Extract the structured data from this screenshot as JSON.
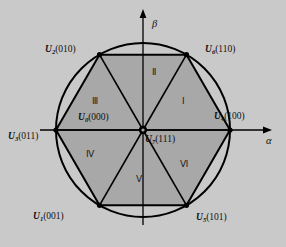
{
  "figure": {
    "kind": "space-vector-hexagon",
    "background_color": "#c9c9c9",
    "hexagon_fill": "#a8a8a8",
    "line_color": "#000000",
    "center": {
      "x": 143,
      "y": 130
    },
    "circle_radius": 87,
    "hexagon_radius": 87
  },
  "axes": {
    "alpha": {
      "label": "α",
      "direction": "right"
    },
    "beta": {
      "label": "β",
      "direction": "up"
    }
  },
  "vectors": [
    {
      "id": "U4",
      "name": "U",
      "index": "4",
      "bits": "(100)",
      "angle_deg": 0,
      "label": "U4(100)"
    },
    {
      "id": "U6",
      "name": "U",
      "index": "6",
      "bits": "(110)",
      "angle_deg": 60,
      "label": "U6(110)"
    },
    {
      "id": "U2",
      "name": "U",
      "index": "2",
      "bits": "(010)",
      "angle_deg": 120,
      "label": "U2(010)"
    },
    {
      "id": "U3",
      "name": "U",
      "index": "3",
      "bits": "(011)",
      "angle_deg": 180,
      "label": "U3(011)"
    },
    {
      "id": "U1",
      "name": "U",
      "index": "1",
      "bits": "(001)",
      "angle_deg": 240,
      "label": "U1(001)"
    },
    {
      "id": "U5",
      "name": "U",
      "index": "5",
      "bits": "(101)",
      "angle_deg": 300,
      "label": "U5(101)"
    }
  ],
  "zero_vectors": [
    {
      "id": "U0",
      "name": "U",
      "index": "0",
      "bits": "(000)",
      "label": "U0(000)"
    },
    {
      "id": "U7",
      "name": "U",
      "index": "7",
      "bits": "(111)",
      "label": "U7(111)"
    }
  ],
  "sectors": [
    {
      "id": "I",
      "label": "Ⅰ",
      "range_deg": [
        0,
        60
      ]
    },
    {
      "id": "II",
      "label": "Ⅱ",
      "range_deg": [
        60,
        120
      ]
    },
    {
      "id": "III",
      "label": "Ⅲ",
      "range_deg": [
        120,
        180
      ]
    },
    {
      "id": "IV",
      "label": "Ⅳ",
      "range_deg": [
        180,
        240
      ]
    },
    {
      "id": "V",
      "label": "Ⅴ",
      "range_deg": [
        240,
        300
      ]
    },
    {
      "id": "VI",
      "label": "Ⅵ",
      "range_deg": [
        300,
        360
      ]
    }
  ]
}
